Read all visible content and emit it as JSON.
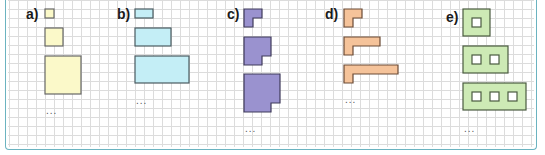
{
  "colors": {
    "frame": "#6bb3c0",
    "grid": "#dcdcdc",
    "outline": "#555555",
    "a_fill": "#fbf9c9",
    "b_fill": "#c4eef6",
    "c_fill": "#9a92cf",
    "d_fill": "#f5c39a",
    "e_fill": "#cdeab5"
  },
  "sequences": [
    {
      "label": "a)",
      "description": "growing squares: 1x1, 2x2, 4x4",
      "continuation": "..."
    },
    {
      "label": "b)",
      "description": "growing rectangles: 2x1, 4x2, 6x3",
      "continuation": "..."
    },
    {
      "label": "c)",
      "description": "squares missing bottom-right cell: 2x2, 3x3, 4x4",
      "continuation": "..."
    },
    {
      "label": "d)",
      "description": "L-shapes with growing top arm: 2, 4, 6 cells wide",
      "continuation": "..."
    },
    {
      "label": "e)",
      "description": "3-row frames with 1, 2, 3 square holes",
      "continuation": "..."
    }
  ]
}
